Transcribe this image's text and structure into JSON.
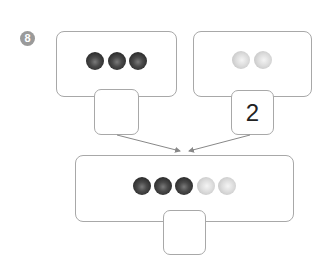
{
  "problem": {
    "number": "8"
  },
  "left_group": {
    "count_label": "",
    "dots": [
      "dark",
      "dark",
      "dark"
    ]
  },
  "right_group": {
    "count_label": "2",
    "dots": [
      "light",
      "light"
    ]
  },
  "combined_group": {
    "count_label": "",
    "dots": [
      "dark",
      "dark",
      "dark",
      "light",
      "light"
    ]
  },
  "colors": {
    "border": "#a8a8a8",
    "dark_dot": "#3a3a3a",
    "light_dot": "#d4d4d4",
    "badge": "#9a9a9a",
    "arrow": "#888888"
  }
}
